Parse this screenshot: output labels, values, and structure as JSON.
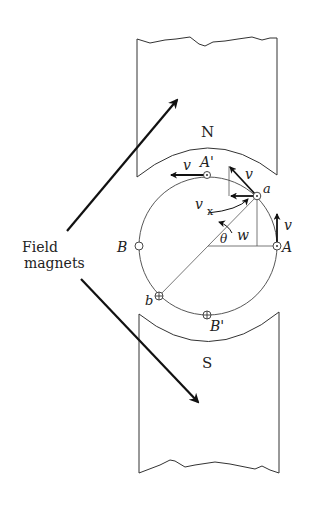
{
  "diagram": {
    "type": "dc generator / armature in magnetic field",
    "labels": {
      "north_pole": "N",
      "south_pole": "S",
      "field_magnets_line1": "Field",
      "field_magnets_line2": "magnets",
      "conductor_A": "A",
      "conductor_A_prime": "A'",
      "conductor_B": "B",
      "conductor_B_prime": "B'",
      "conductor_a": "a",
      "conductor_b": "b",
      "velocity_top": "v",
      "velocity_a": "v",
      "velocity_A": "v",
      "velocity_x": "v",
      "velocity_x_sub": "x",
      "angle": "θ",
      "angular_velocity": "w"
    },
    "colors": {
      "stroke": "#333333",
      "arrow": "#111111",
      "background": "#ffffff"
    }
  }
}
